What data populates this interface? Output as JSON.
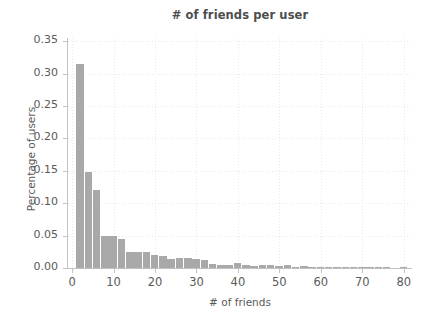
{
  "chart_data": {
    "type": "bar",
    "title": "# of friends per user",
    "xlabel": "# of friends",
    "ylabel": "Percentage of users",
    "xlim": [
      -1,
      82
    ],
    "ylim": [
      0.0,
      0.355
    ],
    "grid": true,
    "grid_style": "dotted",
    "legend": "none",
    "bar_color": "#a9a9a9",
    "bin_width": 2,
    "yticks": [
      0.0,
      0.05,
      0.1,
      0.15,
      0.2,
      0.25,
      0.3,
      0.35
    ],
    "ytick_labels": [
      "0.00",
      "0.05",
      "0.10",
      "0.15",
      "0.20",
      "0.25",
      "0.30",
      "0.35"
    ],
    "xticks": [
      0,
      10,
      20,
      30,
      40,
      50,
      60,
      70,
      80
    ],
    "xtick_labels": [
      "0",
      "10",
      "20",
      "30",
      "40",
      "50",
      "60",
      "70",
      "80"
    ],
    "x": [
      2,
      4,
      6,
      8,
      10,
      12,
      14,
      16,
      18,
      20,
      22,
      24,
      26,
      28,
      30,
      32,
      34,
      36,
      38,
      40,
      42,
      44,
      46,
      48,
      50,
      52,
      54,
      56,
      58,
      60,
      62,
      64,
      66,
      68,
      70,
      72,
      74,
      76,
      78,
      80
    ],
    "values": [
      0.315,
      0.148,
      0.121,
      0.049,
      0.049,
      0.045,
      0.024,
      0.025,
      0.025,
      0.02,
      0.019,
      0.014,
      0.015,
      0.015,
      0.014,
      0.013,
      0.006,
      0.004,
      0.005,
      0.008,
      0.004,
      0.003,
      0.004,
      0.004,
      0.003,
      0.004,
      0.002,
      0.003,
      0.002,
      0.002,
      0.002,
      0.002,
      0.001,
      0.001,
      0.002,
      0.001,
      0.001,
      0.001,
      0.0,
      0.001
    ]
  },
  "figure": {
    "background_color": "#ffffff",
    "axis_color": "#c2c2c2",
    "text_color": "#5a5a5a",
    "title_color": "#4d4d4d"
  }
}
